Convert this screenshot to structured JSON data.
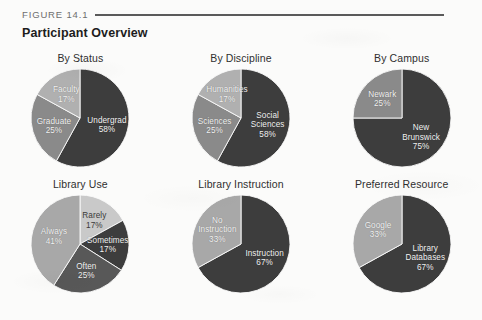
{
  "figure": {
    "label": "FIGURE 14.1",
    "title": "Participant Overview"
  },
  "colors": {
    "dark": "#3d3d3d",
    "mid": "#8a8a8a",
    "light": "#b0b0b0",
    "lightest": "#c9c9c9",
    "page_background": "#fbfbfa",
    "rule": "#5a5a5a"
  },
  "chart_data": [
    {
      "type": "pie",
      "title": "By Status",
      "categories": [
        "Undergrad",
        "Graduate",
        "Faculty"
      ],
      "values": [
        58,
        25,
        17
      ],
      "unit": "%",
      "labels": [
        {
          "text": "Undergrad\n58%",
          "color": "#3d3d3d"
        },
        {
          "text": "Graduate\n25%",
          "color": "#8a8a8a"
        },
        {
          "text": "Faculty\n17%",
          "color": "#b0b0b0"
        }
      ],
      "legend": "none",
      "start_angle": 0
    },
    {
      "type": "pie",
      "title": "By Discipline",
      "categories": [
        "Social Sciences",
        "Sciences",
        "Humanities"
      ],
      "values": [
        58,
        25,
        17
      ],
      "unit": "%",
      "labels": [
        {
          "text": "Social\nSciences\n58%",
          "color": "#3d3d3d"
        },
        {
          "text": "Sciences\n25%",
          "color": "#8a8a8a"
        },
        {
          "text": "Humanities\n17%",
          "color": "#b0b0b0"
        }
      ],
      "legend": "none",
      "start_angle": 0
    },
    {
      "type": "pie",
      "title": "By Campus",
      "categories": [
        "New Brunswick",
        "Newark"
      ],
      "values": [
        75,
        25
      ],
      "unit": "%",
      "labels": [
        {
          "text": "New\nBrunswick\n75%",
          "color": "#3d3d3d"
        },
        {
          "text": "Newark\n25%",
          "color": "#8a8a8a"
        }
      ],
      "legend": "none",
      "start_angle": 0
    },
    {
      "type": "pie",
      "title": "Library Use",
      "categories": [
        "Rarely",
        "Sometimes",
        "Often",
        "Always"
      ],
      "values": [
        17,
        17,
        25,
        41
      ],
      "unit": "%",
      "labels": [
        {
          "text": "Rarely\n17%",
          "color": "#c9c9c9"
        },
        {
          "text": "Sometimes\n17%",
          "color": "#3d3d3d"
        },
        {
          "text": "Often\n25%",
          "color": "#585858"
        },
        {
          "text": "Always\n41%",
          "color": "#a8a8a8"
        }
      ],
      "legend": "none",
      "start_angle": 0
    },
    {
      "type": "pie",
      "title": "Library Instruction",
      "categories": [
        "Instruction",
        "No Instruction"
      ],
      "values": [
        67,
        33
      ],
      "unit": "%",
      "labels": [
        {
          "text": "Instruction\n67%",
          "color": "#3d3d3d"
        },
        {
          "text": "No\nInstruction\n33%",
          "color": "#a8a8a8"
        }
      ],
      "legend": "none",
      "start_angle": 0
    },
    {
      "type": "pie",
      "title": "Preferred Resource",
      "categories": [
        "Library Databases",
        "Google"
      ],
      "values": [
        67,
        33
      ],
      "unit": "%",
      "labels": [
        {
          "text": "Library\nDatabases\n67%",
          "color": "#3d3d3d"
        },
        {
          "text": "Google\n33%",
          "color": "#a8a8a8"
        }
      ],
      "legend": "none",
      "start_angle": 0
    }
  ]
}
